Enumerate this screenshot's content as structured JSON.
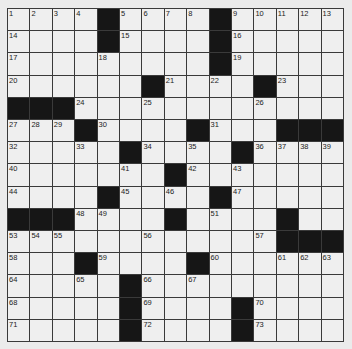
{
  "puzzle": {
    "rows": 15,
    "cols": 15,
    "colors": {
      "background": "#ebebeb",
      "cell": "#efefef",
      "block": "#161616",
      "line": "#3a3a3a"
    },
    "grid": [
      "....#....#.....",
      "....#....#.....",
      ".........#.....",
      "......#....#...",
      "###...........",
      "...#....#...###",
      ".....#....#....",
      ".......#.......",
      "....#....#.....",
      "###....#....#..",
      "............###",
      "...#....#......",
      ".....#.........",
      ".....#....#....",
      ".....#....#...."
    ],
    "numbers": [
      {
        "r": 0,
        "c": 0,
        "n": "1"
      },
      {
        "r": 0,
        "c": 1,
        "n": "2"
      },
      {
        "r": 0,
        "c": 2,
        "n": "3"
      },
      {
        "r": 0,
        "c": 3,
        "n": "4"
      },
      {
        "r": 0,
        "c": 5,
        "n": "5"
      },
      {
        "r": 0,
        "c": 6,
        "n": "6"
      },
      {
        "r": 0,
        "c": 7,
        "n": "7"
      },
      {
        "r": 0,
        "c": 8,
        "n": "8"
      },
      {
        "r": 0,
        "c": 10,
        "n": "9"
      },
      {
        "r": 0,
        "c": 11,
        "n": "10"
      },
      {
        "r": 0,
        "c": 12,
        "n": "11"
      },
      {
        "r": 0,
        "c": 13,
        "n": "12"
      },
      {
        "r": 0,
        "c": 14,
        "n": "13"
      },
      {
        "r": 1,
        "c": 0,
        "n": "14"
      },
      {
        "r": 1,
        "c": 5,
        "n": "15"
      },
      {
        "r": 1,
        "c": 10,
        "n": "16"
      },
      {
        "r": 2,
        "c": 0,
        "n": "17"
      },
      {
        "r": 2,
        "c": 4,
        "n": "18"
      },
      {
        "r": 2,
        "c": 10,
        "n": "19"
      },
      {
        "r": 3,
        "c": 0,
        "n": "20"
      },
      {
        "r": 3,
        "c": 7,
        "n": "21"
      },
      {
        "r": 3,
        "c": 9,
        "n": "22"
      },
      {
        "r": 3,
        "c": 12,
        "n": "23"
      },
      {
        "r": 4,
        "c": 3,
        "n": "24"
      },
      {
        "r": 4,
        "c": 6,
        "n": "25"
      },
      {
        "r": 4,
        "c": 11,
        "n": "26"
      },
      {
        "r": 5,
        "c": 0,
        "n": "27"
      },
      {
        "r": 5,
        "c": 1,
        "n": "28"
      },
      {
        "r": 5,
        "c": 2,
        "n": "29"
      },
      {
        "r": 5,
        "c": 4,
        "n": "30"
      },
      {
        "r": 5,
        "c": 9,
        "n": "31"
      },
      {
        "r": 6,
        "c": 0,
        "n": "32"
      },
      {
        "r": 6,
        "c": 3,
        "n": "33"
      },
      {
        "r": 6,
        "c": 6,
        "n": "34"
      },
      {
        "r": 6,
        "c": 8,
        "n": "35"
      },
      {
        "r": 6,
        "c": 11,
        "n": "36"
      },
      {
        "r": 6,
        "c": 12,
        "n": "37"
      },
      {
        "r": 6,
        "c": 13,
        "n": "38"
      },
      {
        "r": 6,
        "c": 14,
        "n": "39"
      },
      {
        "r": 7,
        "c": 0,
        "n": "40"
      },
      {
        "r": 7,
        "c": 5,
        "n": "41"
      },
      {
        "r": 7,
        "c": 8,
        "n": "42"
      },
      {
        "r": 7,
        "c": 10,
        "n": "43"
      },
      {
        "r": 8,
        "c": 0,
        "n": "44"
      },
      {
        "r": 8,
        "c": 5,
        "n": "45"
      },
      {
        "r": 8,
        "c": 7,
        "n": "46"
      },
      {
        "r": 8,
        "c": 10,
        "n": "47"
      },
      {
        "r": 9,
        "c": 3,
        "n": "48"
      },
      {
        "r": 9,
        "c": 4,
        "n": "49"
      },
      {
        "r": 9,
        "c": 7,
        "n": "50"
      },
      {
        "r": 9,
        "c": 9,
        "n": "51"
      },
      {
        "r": 9,
        "c": 12,
        "n": "52"
      },
      {
        "r": 10,
        "c": 0,
        "n": "53"
      },
      {
        "r": 10,
        "c": 1,
        "n": "54"
      },
      {
        "r": 10,
        "c": 2,
        "n": "55"
      },
      {
        "r": 10,
        "c": 6,
        "n": "56"
      },
      {
        "r": 10,
        "c": 11,
        "n": "57"
      },
      {
        "r": 11,
        "c": 0,
        "n": "58"
      },
      {
        "r": 11,
        "c": 4,
        "n": "59"
      },
      {
        "r": 11,
        "c": 9,
        "n": "60"
      },
      {
        "r": 11,
        "c": 12,
        "n": "61"
      },
      {
        "r": 11,
        "c": 13,
        "n": "62"
      },
      {
        "r": 11,
        "c": 14,
        "n": "63"
      },
      {
        "r": 12,
        "c": 0,
        "n": "64"
      },
      {
        "r": 12,
        "c": 3,
        "n": "65"
      },
      {
        "r": 12,
        "c": 6,
        "n": "66"
      },
      {
        "r": 12,
        "c": 8,
        "n": "67"
      },
      {
        "r": 13,
        "c": 0,
        "n": "68"
      },
      {
        "r": 13,
        "c": 6,
        "n": "69"
      },
      {
        "r": 13,
        "c": 11,
        "n": "70"
      },
      {
        "r": 14,
        "c": 0,
        "n": "71"
      },
      {
        "r": 14,
        "c": 6,
        "n": "72"
      },
      {
        "r": 14,
        "c": 11,
        "n": "73"
      }
    ]
  }
}
